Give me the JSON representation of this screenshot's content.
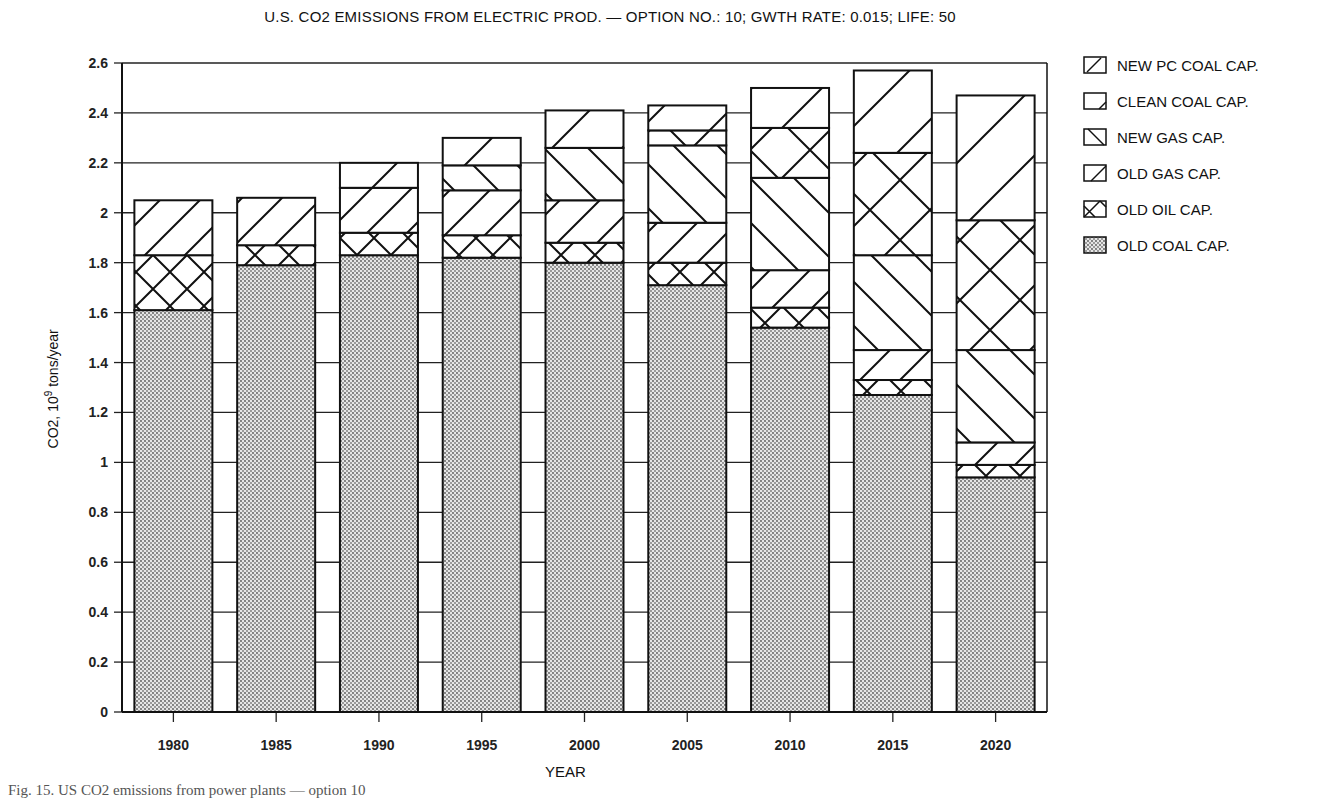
{
  "chart_data": {
    "type": "bar",
    "stacked": true,
    "title": "U.S. CO2 EMISSIONS FROM ELECTRIC PROD. — OPTION NO.: 10; GWTH RATE: 0.015; LIFE: 50",
    "xlabel": "YEAR",
    "ylabel": "CO2, 10^9 tons/year",
    "ylim": [
      0,
      2.6
    ],
    "yticks": [
      0,
      0.2,
      0.4,
      0.6,
      0.8,
      1,
      1.2,
      1.4,
      1.6,
      1.8,
      2,
      2.2,
      2.4,
      2.6
    ],
    "grid": true,
    "legend_position": "right",
    "categories": [
      "1980",
      "1985",
      "1990",
      "1995",
      "2000",
      "2005",
      "2010",
      "2015",
      "2020"
    ],
    "series": [
      {
        "name": "OLD COAL CAP.",
        "pattern": "dots",
        "values": [
          1.61,
          1.79,
          1.83,
          1.82,
          1.8,
          1.71,
          1.54,
          1.27,
          0.94
        ]
      },
      {
        "name": "OLD OIL CAP.",
        "pattern": "crosshatch",
        "values": [
          0.22,
          0.08,
          0.09,
          0.09,
          0.08,
          0.09,
          0.08,
          0.06,
          0.05
        ]
      },
      {
        "name": "OLD GAS CAP.",
        "pattern": "forward-diagonal",
        "values": [
          0.22,
          0.19,
          0.18,
          0.18,
          0.17,
          0.16,
          0.15,
          0.12,
          0.09
        ]
      },
      {
        "name": "NEW GAS CAP.",
        "pattern": "back-diagonal",
        "values": [
          0,
          0,
          0,
          0.1,
          0.21,
          0.31,
          0.37,
          0.38,
          0.37
        ]
      },
      {
        "name": "CLEAN COAL CAP.",
        "pattern": "large-crosshatch",
        "values": [
          0,
          0,
          0,
          0,
          0,
          0.06,
          0.2,
          0.41,
          0.52
        ]
      },
      {
        "name": "NEW PC COAL CAP.",
        "pattern": "wide-forward-diagonal",
        "values": [
          0,
          0,
          0.1,
          0.11,
          0.15,
          0.1,
          0.16,
          0.33,
          0.5
        ]
      }
    ],
    "totals": [
      2.05,
      2.06,
      2.2,
      2.3,
      2.41,
      2.43,
      2.5,
      2.57,
      2.47
    ]
  },
  "legend": {
    "items": [
      {
        "label": "NEW PC COAL CAP."
      },
      {
        "label": "CLEAN COAL CAP."
      },
      {
        "label": "NEW GAS CAP."
      },
      {
        "label": "OLD GAS CAP."
      },
      {
        "label": "OLD OIL CAP."
      },
      {
        "label": "OLD COAL CAP."
      }
    ]
  },
  "axis": {
    "ylabel_main": "CO2, 10",
    "ylabel_sup": "9",
    "ylabel_unit": " tons/year",
    "xlabel": "YEAR"
  },
  "caption": "Fig. 15.  US CO2 emissions from power plants — option 10"
}
